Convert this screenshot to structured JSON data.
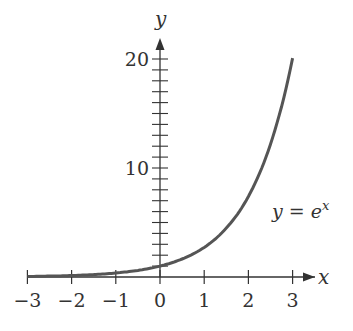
{
  "chart_data": {
    "type": "line",
    "title": "",
    "xlabel": "x",
    "ylabel": "y",
    "xlim": [
      -3,
      3
    ],
    "ylim": [
      0,
      21
    ],
    "grid": false,
    "x_ticks": [
      "−3",
      "−2",
      "−1",
      "0",
      "1",
      "2",
      "3"
    ],
    "y_ticks": [
      "10",
      "20"
    ],
    "y_minor_tick_step": 1,
    "annotation": {
      "text_prefix": "y = e",
      "superscript": "x"
    },
    "series": [
      {
        "name": "y = e^x",
        "x": [
          -3,
          -2.5,
          -2,
          -1.5,
          -1,
          -0.5,
          0,
          0.5,
          1,
          1.5,
          2,
          2.5,
          3
        ],
        "values": [
          0.05,
          0.08,
          0.14,
          0.22,
          0.37,
          0.61,
          1.0,
          1.65,
          2.72,
          4.48,
          7.39,
          12.18,
          20.09
        ]
      }
    ],
    "colors": {
      "curve": "#555555",
      "axes": "#333333"
    }
  }
}
